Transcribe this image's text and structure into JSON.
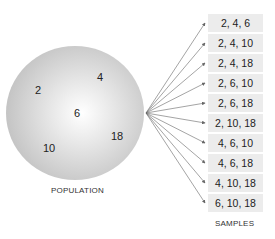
{
  "population": {
    "label": "POPULATION",
    "values": [
      "2",
      "4",
      "6",
      "10",
      "18"
    ]
  },
  "samples": {
    "label": "SAMPLES",
    "items": [
      "2, 4, 6",
      "2, 4, 10",
      "2, 4, 18",
      "2, 6, 10",
      "2, 6, 18",
      "2, 10, 18",
      "4, 6, 10",
      "4, 6, 18",
      "4, 10, 18",
      "6, 10, 18"
    ]
  },
  "colors": {
    "box": "#ececec",
    "arrow": "#666666",
    "circle_edge": "#b0b0b0"
  }
}
